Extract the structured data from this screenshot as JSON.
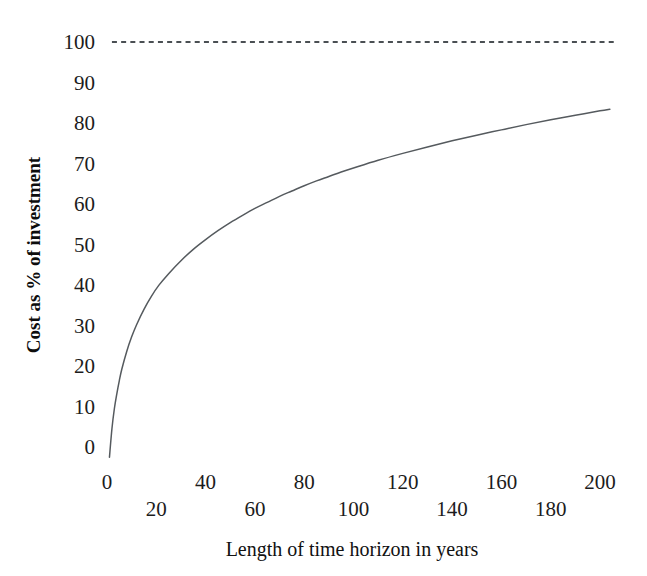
{
  "chart_data": {
    "type": "line",
    "title": "",
    "xlabel": "Length of time horizon in years",
    "ylabel": "Cost as % of investment",
    "xlim": [
      0,
      205
    ],
    "ylim": [
      -3,
      103
    ],
    "grid": false,
    "legend": "none",
    "xticks": [
      0,
      20,
      40,
      60,
      80,
      100,
      120,
      140,
      160,
      180,
      200
    ],
    "xtick_labels": [
      "0",
      "20",
      "40",
      "60",
      "80",
      "100",
      "120",
      "140",
      "160",
      "180",
      "200"
    ],
    "xtick_rows": [
      0,
      1,
      0,
      1,
      0,
      1,
      0,
      1,
      0,
      1,
      0
    ],
    "yticks": [
      0,
      10,
      20,
      30,
      40,
      50,
      60,
      70,
      80,
      90,
      100
    ],
    "ytick_labels": [
      "0",
      "10",
      "20",
      "30",
      "40",
      "50",
      "60",
      "70",
      "80",
      "90",
      "100"
    ],
    "series": [
      {
        "name": "Cost curve",
        "style": "solid",
        "color": "#555a5e",
        "x": [
          1,
          2,
          3,
          4,
          5,
          6,
          8,
          10,
          12,
          15,
          18,
          21,
          25,
          30,
          35,
          40,
          45,
          50,
          55,
          60,
          65,
          70,
          75,
          80,
          85,
          90,
          95,
          100,
          110,
          120,
          130,
          140,
          150,
          160,
          170,
          180,
          190,
          200,
          204
        ],
        "y": [
          -2.5,
          4.5,
          9.5,
          13.2,
          16.4,
          19.2,
          23.6,
          27.2,
          30.2,
          34.0,
          37.2,
          39.9,
          42.8,
          46.0,
          48.8,
          51.2,
          53.4,
          55.4,
          57.2,
          58.9,
          60.4,
          61.9,
          63.2,
          64.5,
          65.7,
          66.8,
          67.9,
          68.9,
          70.8,
          72.5,
          74.1,
          75.6,
          77.0,
          78.3,
          79.6,
          80.8,
          81.9,
          83.0,
          83.4
        ]
      },
      {
        "name": "Investment reference (100%)",
        "style": "dashed",
        "color": "#4a4f53",
        "x": [
          2,
          207
        ],
        "y": [
          100,
          100
        ]
      }
    ],
    "annotations": []
  },
  "axes": {
    "y_title": "Cost as % of investment",
    "x_title": "Length of time horizon in years"
  }
}
